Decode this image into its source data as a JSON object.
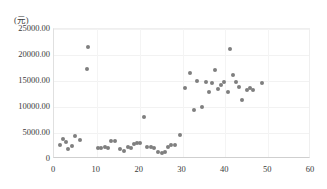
{
  "chart_data": {
    "type": "scatter",
    "title": "",
    "subtitle": "",
    "xlabel": "",
    "ylabel": "(元)",
    "unit_label": "(元)",
    "xlim": [
      0,
      60
    ],
    "ylim": [
      0,
      25000
    ],
    "grid": true,
    "legend": "none",
    "marker_color": "#7f7f7f",
    "xticks": [
      0,
      10,
      20,
      30,
      40,
      50,
      60
    ],
    "xtick_labels": [
      "0",
      "10",
      "20",
      "30",
      "40",
      "50",
      "60"
    ],
    "yticks": [
      0,
      5000,
      10000,
      15000,
      20000,
      25000
    ],
    "ytick_labels": [
      "0",
      "5000.00",
      "10000.00",
      "15000.00",
      "20000.00",
      "25000.00"
    ],
    "series": [
      {
        "name": "series-1",
        "points": [
          [
            1.3,
            2600
          ],
          [
            2.2,
            3800
          ],
          [
            2.9,
            3200
          ],
          [
            3.3,
            2000
          ],
          [
            4.2,
            2500
          ],
          [
            5.0,
            4400
          ],
          [
            6.0,
            3700
          ],
          [
            7.6,
            17400
          ],
          [
            8.0,
            21600
          ],
          [
            10.2,
            2200
          ],
          [
            11.0,
            2100
          ],
          [
            11.8,
            2300
          ],
          [
            12.6,
            2200
          ],
          [
            13.4,
            3400
          ],
          [
            14.3,
            3500
          ],
          [
            15.5,
            1900
          ],
          [
            16.3,
            1500
          ],
          [
            17.2,
            2400
          ],
          [
            17.9,
            2100
          ],
          [
            18.6,
            2800
          ],
          [
            19.3,
            3000
          ],
          [
            20.1,
            3100
          ],
          [
            21.0,
            8000
          ],
          [
            21.8,
            2400
          ],
          [
            22.6,
            2300
          ],
          [
            23.4,
            2100
          ],
          [
            24.3,
            1300
          ],
          [
            25.1,
            1200
          ],
          [
            25.8,
            1300
          ],
          [
            26.6,
            2400
          ],
          [
            27.4,
            2600
          ],
          [
            28.2,
            2700
          ],
          [
            29.4,
            4700
          ],
          [
            30.5,
            13600
          ],
          [
            31.8,
            16600
          ],
          [
            32.6,
            9500
          ],
          [
            33.4,
            15000
          ],
          [
            34.6,
            10000
          ],
          [
            35.4,
            14800
          ],
          [
            36.2,
            12900
          ],
          [
            36.9,
            14700
          ],
          [
            37.6,
            17200
          ],
          [
            38.4,
            13500
          ],
          [
            39.1,
            14300
          ],
          [
            39.8,
            14900
          ],
          [
            40.6,
            12900
          ],
          [
            41.2,
            21200
          ],
          [
            41.8,
            16100
          ],
          [
            42.4,
            14800
          ],
          [
            43.2,
            13800
          ],
          [
            43.8,
            11400
          ],
          [
            45.0,
            13200
          ],
          [
            45.8,
            13600
          ],
          [
            46.5,
            13300
          ],
          [
            48.5,
            14700
          ]
        ]
      }
    ]
  }
}
